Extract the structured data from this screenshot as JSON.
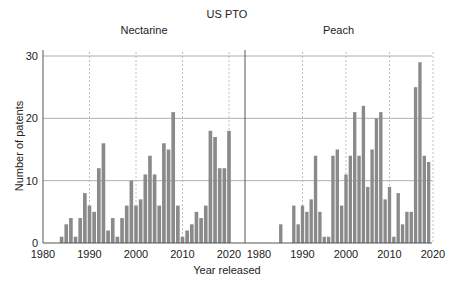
{
  "title": "US PTO",
  "xlabel": "Year released",
  "ylabel": "Number of patents",
  "panels": [
    {
      "label": "Nectarine"
    },
    {
      "label": "Peach"
    }
  ],
  "colors": {
    "bar": "#8a8a8a",
    "grid": "#b0b0b0",
    "axis": "#555555"
  },
  "chart_data": {
    "type": "bar",
    "title": "US PTO",
    "xlabel": "Year released",
    "ylabel": "Number of patents",
    "ylim": [
      0,
      30
    ],
    "yticks": [
      0,
      10,
      20,
      30
    ],
    "xticks": [
      1980,
      1990,
      2000,
      2010,
      2020
    ],
    "grid": true,
    "facets": [
      "Nectarine",
      "Peach"
    ],
    "series": [
      {
        "name": "Nectarine",
        "x": [
          1984,
          1985,
          1986,
          1987,
          1988,
          1989,
          1990,
          1991,
          1992,
          1993,
          1994,
          1995,
          1996,
          1997,
          1998,
          1999,
          2000,
          2001,
          2002,
          2003,
          2004,
          2005,
          2006,
          2007,
          2008,
          2009,
          2010,
          2011,
          2012,
          2013,
          2014,
          2015,
          2016,
          2017,
          2018,
          2019,
          2020
        ],
        "values": [
          1,
          3,
          4,
          1,
          4,
          8,
          6,
          5,
          12,
          16,
          2,
          4,
          1,
          4,
          6,
          10,
          6,
          7,
          11,
          14,
          11,
          6,
          16,
          15,
          21,
          6,
          1,
          2,
          3,
          5,
          4,
          6,
          18,
          17,
          12,
          12,
          18
        ]
      },
      {
        "name": "Peach",
        "x": [
          1985,
          1988,
          1989,
          1990,
          1991,
          1992,
          1993,
          1994,
          1995,
          1996,
          1997,
          1998,
          1999,
          2000,
          2001,
          2002,
          2003,
          2004,
          2005,
          2006,
          2007,
          2008,
          2009,
          2010,
          2011,
          2012,
          2013,
          2014,
          2015,
          2016,
          2017,
          2018,
          2019
        ],
        "values": [
          3,
          6,
          3,
          6,
          5,
          7,
          14,
          5,
          1,
          1,
          14,
          15,
          6,
          11,
          14,
          21,
          14,
          22,
          9,
          15,
          20,
          21,
          7,
          9,
          1,
          8,
          3,
          5,
          5,
          25,
          29,
          14,
          13
        ]
      }
    ]
  }
}
